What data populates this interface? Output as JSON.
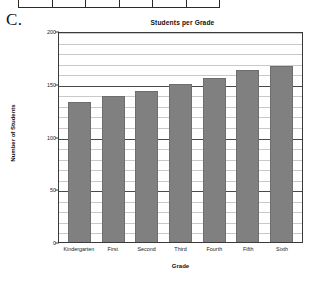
{
  "figure": {
    "letter": "C."
  },
  "table_fragment": {
    "name": "cropped-table-above",
    "cell_count": 6
  },
  "chart_data": {
    "type": "bar",
    "title": "Students per Grade",
    "xlabel": "Grade",
    "ylabel": "Number of Students",
    "categories": [
      "Kindergarten",
      "First",
      "Second",
      "Third",
      "Fourth",
      "Fifth",
      "Sixth"
    ],
    "values": [
      133,
      138,
      143,
      150,
      155,
      163,
      167
    ],
    "ylim": [
      0,
      200
    ],
    "yticks": [
      0,
      50,
      100,
      150,
      200
    ],
    "ytick_labels": [
      "0",
      "50",
      "100",
      "150",
      "200"
    ],
    "grid": true,
    "grid_minor_step": 10,
    "legend": null,
    "bar_color": "#808080",
    "axis_color": "#3a3a3a",
    "gridline_color": "#c9c9c9"
  }
}
